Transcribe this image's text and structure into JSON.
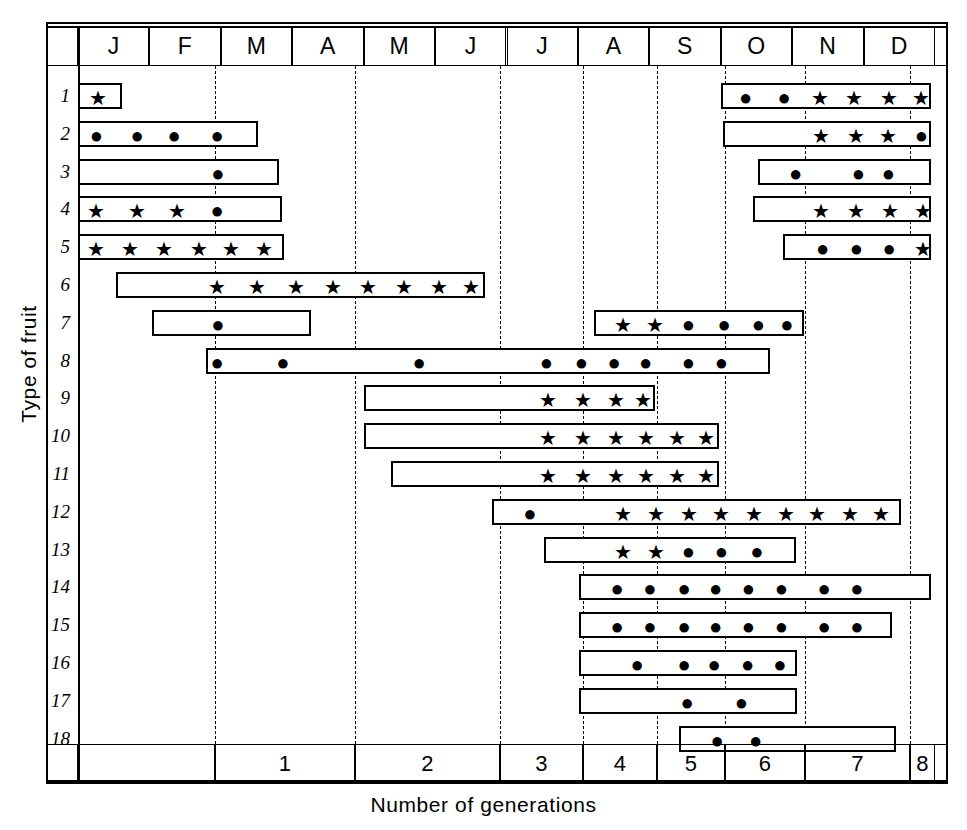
{
  "chart_data": {
    "type": "bar",
    "title": "",
    "xlabel": "Number of generations",
    "ylabel": "Type of fruit",
    "grid": true,
    "legend_position": "none",
    "top_axis": {
      "name": "month",
      "tick_labels": [
        "J",
        "F",
        "M",
        "A",
        "M",
        "J",
        "J",
        "A",
        "S",
        "O",
        "N",
        "D"
      ]
    },
    "bottom_axis": {
      "name": "generation",
      "tick_labels": [
        "1",
        "2",
        "3",
        "4",
        "5",
        "6",
        "7",
        "8"
      ],
      "first_cell_blank": true
    },
    "categories": [
      "1",
      "2",
      "3",
      "4",
      "5",
      "6",
      "7",
      "8",
      "9",
      "10",
      "11",
      "12",
      "13",
      "14",
      "15",
      "16",
      "17",
      "18"
    ],
    "marker_legend": {
      "dot": "●",
      "star": "★"
    },
    "series": [
      {
        "name": "1",
        "bars": [
          {
            "start_month": 0.0,
            "end_month": 0.62,
            "markers": [
              {
                "m": "star",
                "at": 0.25
              }
            ]
          },
          {
            "start_month": 9.0,
            "end_month": 11.95,
            "markers": [
              {
                "m": "dot",
                "at": 9.32
              },
              {
                "m": "dot",
                "at": 9.86
              },
              {
                "m": "star",
                "at": 10.36
              },
              {
                "m": "star",
                "at": 10.84
              },
              {
                "m": "star",
                "at": 11.33
              },
              {
                "m": "star",
                "at": 11.78
              }
            ]
          }
        ]
      },
      {
        "name": "2",
        "bars": [
          {
            "start_month": 0.0,
            "end_month": 2.52,
            "markers": [
              {
                "m": "dot",
                "at": 0.23
              },
              {
                "m": "dot",
                "at": 0.8
              },
              {
                "m": "dot",
                "at": 1.32
              },
              {
                "m": "dot",
                "at": 1.92
              }
            ]
          },
          {
            "start_month": 9.03,
            "end_month": 11.95,
            "markers": [
              {
                "m": "star",
                "at": 10.37
              },
              {
                "m": "star",
                "at": 10.86
              },
              {
                "m": "star",
                "at": 11.32
              },
              {
                "m": "dot",
                "at": 11.78
              }
            ]
          }
        ]
      },
      {
        "name": "3",
        "bars": [
          {
            "start_month": 0.0,
            "end_month": 2.82,
            "markers": [
              {
                "m": "dot",
                "at": 1.93
              }
            ]
          },
          {
            "start_month": 9.52,
            "end_month": 11.95,
            "markers": [
              {
                "m": "dot",
                "at": 10.02
              },
              {
                "m": "dot",
                "at": 10.9
              },
              {
                "m": "dot",
                "at": 11.32
              }
            ]
          }
        ]
      },
      {
        "name": "4",
        "bars": [
          {
            "start_month": 0.0,
            "end_month": 2.85,
            "markers": [
              {
                "m": "star",
                "at": 0.22
              },
              {
                "m": "star",
                "at": 0.8
              },
              {
                "m": "star",
                "at": 1.36
              },
              {
                "m": "dot",
                "at": 1.92
              }
            ]
          },
          {
            "start_month": 9.45,
            "end_month": 11.95,
            "markers": [
              {
                "m": "star",
                "at": 10.38
              },
              {
                "m": "star",
                "at": 10.86
              },
              {
                "m": "star",
                "at": 11.34
              },
              {
                "m": "star",
                "at": 11.8
              }
            ]
          }
        ]
      },
      {
        "name": "5",
        "bars": [
          {
            "start_month": 0.0,
            "end_month": 2.88,
            "markers": [
              {
                "m": "star",
                "at": 0.22
              },
              {
                "m": "star",
                "at": 0.7
              },
              {
                "m": "star",
                "at": 1.18
              },
              {
                "m": "star",
                "at": 1.66
              },
              {
                "m": "star",
                "at": 2.12
              },
              {
                "m": "star",
                "at": 2.58
              }
            ]
          },
          {
            "start_month": 9.87,
            "end_month": 11.95,
            "markers": [
              {
                "m": "dot",
                "at": 10.4
              },
              {
                "m": "dot",
                "at": 10.87
              },
              {
                "m": "dot",
                "at": 11.33
              },
              {
                "m": "star",
                "at": 11.8
              }
            ]
          }
        ]
      },
      {
        "name": "6",
        "bars": [
          {
            "start_month": 0.53,
            "end_month": 5.7,
            "markers": [
              {
                "m": "star",
                "at": 1.92
              },
              {
                "m": "star",
                "at": 2.48
              },
              {
                "m": "star",
                "at": 3.02
              },
              {
                "m": "star",
                "at": 3.54
              },
              {
                "m": "star",
                "at": 4.03
              },
              {
                "m": "star",
                "at": 4.54
              },
              {
                "m": "star",
                "at": 5.02
              },
              {
                "m": "star",
                "at": 5.48
              }
            ]
          }
        ]
      },
      {
        "name": "7",
        "bars": [
          {
            "start_month": 1.04,
            "end_month": 3.26,
            "markers": [
              {
                "m": "dot",
                "at": 1.93
              }
            ]
          },
          {
            "start_month": 7.22,
            "end_month": 10.17,
            "markers": [
              {
                "m": "star",
                "at": 7.6
              },
              {
                "m": "star",
                "at": 8.05
              },
              {
                "m": "dot",
                "at": 8.52
              },
              {
                "m": "dot",
                "at": 9.02
              },
              {
                "m": "dot",
                "at": 9.5
              },
              {
                "m": "dot",
                "at": 9.9
              }
            ]
          }
        ]
      },
      {
        "name": "8",
        "bars": [
          {
            "start_month": 1.79,
            "end_month": 9.69,
            "markers": [
              {
                "m": "dot",
                "at": 1.92
              },
              {
                "m": "dot",
                "at": 2.84
              },
              {
                "m": "dot",
                "at": 4.75
              },
              {
                "m": "dot",
                "at": 6.53
              },
              {
                "m": "dot",
                "at": 7.02
              },
              {
                "m": "dot",
                "at": 7.48
              },
              {
                "m": "dot",
                "at": 7.92
              },
              {
                "m": "dot",
                "at": 8.52
              },
              {
                "m": "dot",
                "at": 8.98
              }
            ]
          }
        ]
      },
      {
        "name": "9",
        "bars": [
          {
            "start_month": 4.01,
            "end_month": 8.08,
            "markers": [
              {
                "m": "star",
                "at": 6.55
              },
              {
                "m": "star",
                "at": 7.04
              },
              {
                "m": "star",
                "at": 7.5
              },
              {
                "m": "star",
                "at": 7.88
              }
            ]
          }
        ]
      },
      {
        "name": "10",
        "bars": [
          {
            "start_month": 4.01,
            "end_month": 8.98,
            "markers": [
              {
                "m": "star",
                "at": 6.55
              },
              {
                "m": "star",
                "at": 7.04
              },
              {
                "m": "star",
                "at": 7.5
              },
              {
                "m": "star",
                "at": 7.92
              },
              {
                "m": "star",
                "at": 8.36
              },
              {
                "m": "star",
                "at": 8.76
              }
            ]
          }
        ]
      },
      {
        "name": "11",
        "bars": [
          {
            "start_month": 4.38,
            "end_month": 8.98,
            "markers": [
              {
                "m": "star",
                "at": 6.55
              },
              {
                "m": "star",
                "at": 7.04
              },
              {
                "m": "star",
                "at": 7.5
              },
              {
                "m": "star",
                "at": 7.92
              },
              {
                "m": "star",
                "at": 8.36
              },
              {
                "m": "star",
                "at": 8.76
              }
            ]
          }
        ]
      },
      {
        "name": "12",
        "bars": [
          {
            "start_month": 5.79,
            "end_month": 11.52,
            "markers": [
              {
                "m": "dot",
                "at": 6.3
              },
              {
                "m": "star",
                "at": 7.6
              },
              {
                "m": "star",
                "at": 8.06
              },
              {
                "m": "star",
                "at": 8.53
              },
              {
                "m": "star",
                "at": 8.98
              },
              {
                "m": "star",
                "at": 9.44
              },
              {
                "m": "star",
                "at": 9.88
              },
              {
                "m": "star",
                "at": 10.32
              },
              {
                "m": "star",
                "at": 10.78
              },
              {
                "m": "star",
                "at": 11.22
              }
            ]
          }
        ]
      },
      {
        "name": "13",
        "bars": [
          {
            "start_month": 6.53,
            "end_month": 10.05,
            "markers": [
              {
                "m": "star",
                "at": 7.6
              },
              {
                "m": "star",
                "at": 8.06
              },
              {
                "m": "dot",
                "at": 8.52
              },
              {
                "m": "dot",
                "at": 8.98
              },
              {
                "m": "dot",
                "at": 9.48
              }
            ]
          }
        ]
      },
      {
        "name": "14",
        "bars": [
          {
            "start_month": 7.02,
            "end_month": 11.95,
            "markers": [
              {
                "m": "dot",
                "at": 7.52
              },
              {
                "m": "dot",
                "at": 7.98
              },
              {
                "m": "dot",
                "at": 8.46
              },
              {
                "m": "dot",
                "at": 8.9
              },
              {
                "m": "dot",
                "at": 9.36
              },
              {
                "m": "dot",
                "at": 9.82
              },
              {
                "m": "dot",
                "at": 10.42
              },
              {
                "m": "dot",
                "at": 10.88
              }
            ]
          }
        ]
      },
      {
        "name": "15",
        "bars": [
          {
            "start_month": 7.02,
            "end_month": 11.4,
            "markers": [
              {
                "m": "dot",
                "at": 7.52
              },
              {
                "m": "dot",
                "at": 7.98
              },
              {
                "m": "dot",
                "at": 8.46
              },
              {
                "m": "dot",
                "at": 8.9
              },
              {
                "m": "dot",
                "at": 9.36
              },
              {
                "m": "dot",
                "at": 9.82
              },
              {
                "m": "dot",
                "at": 10.42
              },
              {
                "m": "dot",
                "at": 10.88
              }
            ]
          }
        ]
      },
      {
        "name": "16",
        "bars": [
          {
            "start_month": 7.02,
            "end_month": 10.07,
            "markers": [
              {
                "m": "dot",
                "at": 7.8
              },
              {
                "m": "dot",
                "at": 8.46
              },
              {
                "m": "dot",
                "at": 8.88
              },
              {
                "m": "dot",
                "at": 9.35
              },
              {
                "m": "dot",
                "at": 9.8
              }
            ]
          }
        ]
      },
      {
        "name": "17",
        "bars": [
          {
            "start_month": 7.02,
            "end_month": 10.07,
            "markers": [
              {
                "m": "dot",
                "at": 8.5
              },
              {
                "m": "dot",
                "at": 9.26
              }
            ]
          }
        ]
      },
      {
        "name": "18",
        "bars": [
          {
            "start_month": 8.42,
            "end_month": 11.46,
            "markers": [
              {
                "m": "dot",
                "at": 8.92
              },
              {
                "m": "dot",
                "at": 9.46
              }
            ]
          }
        ]
      }
    ]
  }
}
